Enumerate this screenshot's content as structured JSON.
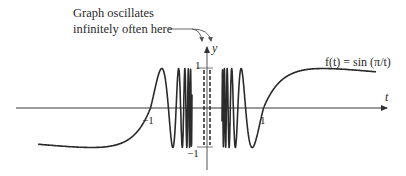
{
  "chart_data": {
    "type": "line",
    "title": "",
    "function_label": "f(t) = sin (π/t)",
    "xlabel": "t",
    "ylabel": "y",
    "x_tick_labels": [
      "−1",
      "1"
    ],
    "y_tick_labels": [
      "1",
      "−1"
    ],
    "annotation": "Graph oscillates infinitely often here",
    "annotation_lines": [
      "Graph oscillates",
      "infinitely often here"
    ],
    "xlim": [
      -3,
      3
    ],
    "ylim": [
      -1,
      1
    ],
    "grid": false,
    "legend": "none",
    "series": [
      {
        "name": "f(t) = sin(π/t)",
        "description": "Oscillates between -1 and 1 infinitely often as t approaches 0; crosses zero at t = -1 and t = 1; minimum -1 near t = -2, maximum 1 near t = 2",
        "key_points": [
          {
            "t": -3,
            "y": -0.25
          },
          {
            "t": -2,
            "y": -1
          },
          {
            "t": -1,
            "y": 0
          },
          {
            "t": 1,
            "y": 0
          },
          {
            "t": 2,
            "y": 1
          },
          {
            "t": 3,
            "y": 0.3
          }
        ]
      }
    ]
  },
  "colors": {
    "curve": "#2b2b2b",
    "axis": "#7a7a7a",
    "text": "#2a2a2a"
  }
}
